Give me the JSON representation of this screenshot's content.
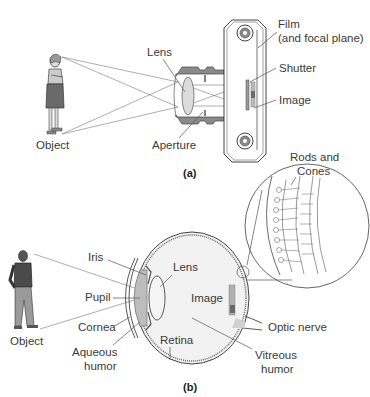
{
  "panel_a": {
    "caption": "(a)",
    "subject": "Camera",
    "labels": {
      "object": "Object",
      "lens": "Lens",
      "aperture": "Aperture",
      "film_line1": "Film",
      "film_line2": "(and focal plane)",
      "shutter": "Shutter",
      "image": "Image"
    }
  },
  "panel_b": {
    "caption": "(b)",
    "subject": "Eye",
    "labels": {
      "object": "Object",
      "iris": "Iris",
      "pupil": "Pupil",
      "cornea": "Cornea",
      "aqueous_line1": "Aqueous",
      "aqueous_line2": "humor",
      "lens": "Lens",
      "image": "Image",
      "retina": "Retina",
      "optic_nerve": "Optic nerve",
      "vitreous_line1": "Vitreous",
      "vitreous_line2": "humor",
      "rods_line1": "Rods and",
      "rods_line2": "Cones"
    }
  },
  "colors": {
    "line": "#555555",
    "fill_gray": "#8a8a8a",
    "fill_light": "#ececec",
    "fill_mid": "#bdbdbd",
    "text": "#3a3a3a"
  }
}
